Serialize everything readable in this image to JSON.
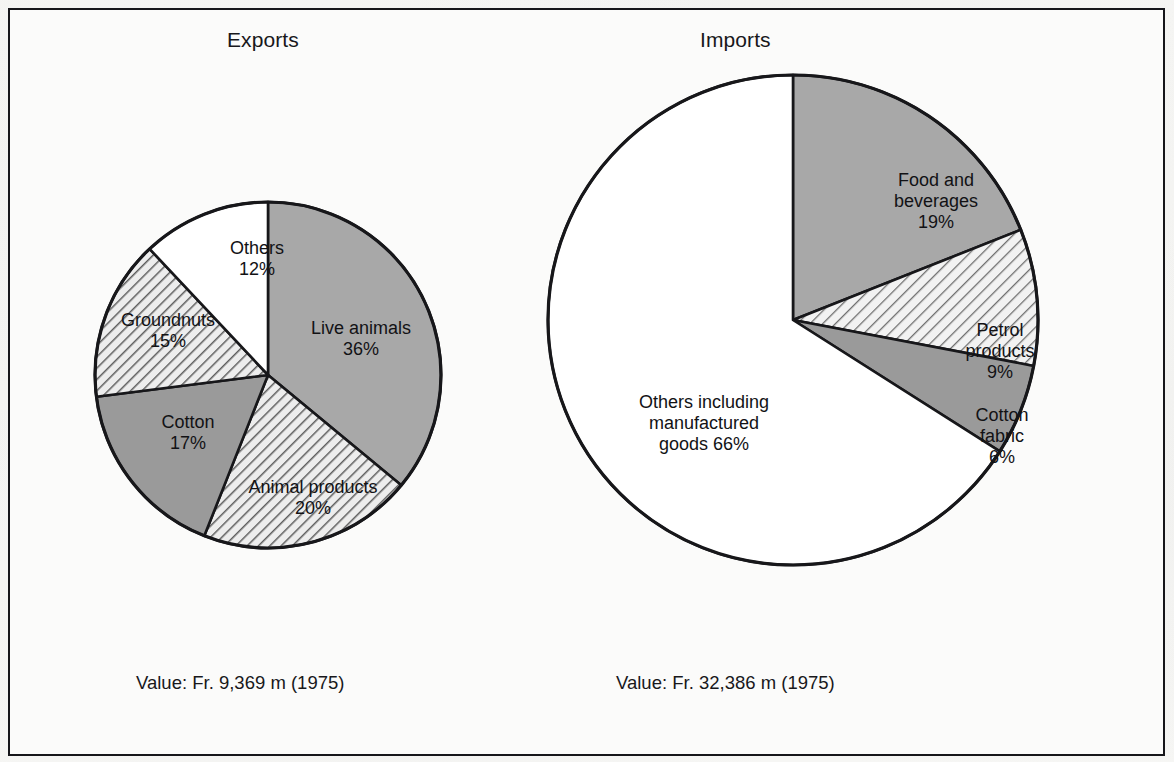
{
  "figure": {
    "background_color": "#f7f7f5",
    "border_color": "#16161a"
  },
  "charts": [
    {
      "id": "exports",
      "title": "Exports",
      "caption": "Value: Fr. 9,369 m (1975)"
    },
    {
      "id": "imports",
      "title": "Imports",
      "caption": "Value: Fr. 32,386 m (1975)"
    }
  ],
  "labels": {
    "exports": {
      "live_animals": "Live animals\n36%",
      "animal_products": "Animal products\n20%",
      "cotton": "Cotton\n17%",
      "groundnuts": "Groundnuts\n15%",
      "others": "Others\n12%"
    },
    "imports": {
      "food_and_beverages": "Food and\nbeverages\n19%",
      "petrol_products": "Petrol\nproducts\n9%",
      "cotton_fabric": "Cotton\nfabric\n6%",
      "others_manufactured": "Others including\nmanufactured\ngoods 66%"
    }
  },
  "chart_data": [
    {
      "type": "pie",
      "id": "exports",
      "title": "Exports",
      "subtitle": "Value: Fr. 9,369 m (1975)",
      "total_value": "Fr. 9,369 m",
      "year": "1975",
      "units": "percent of total export value",
      "start_angle_deg": 0,
      "direction": "clockwise",
      "legend": "inside-slices",
      "labels": [
        "Live animals",
        "Animal products",
        "Cotton",
        "Groundnuts",
        "Others"
      ],
      "values": [
        36,
        20,
        17,
        15,
        12
      ],
      "slices": [
        {
          "label": "Live animals",
          "value": 36,
          "display": "36%",
          "fill": "#a8a8a8",
          "pattern": "solid",
          "start_deg": 0,
          "end_deg": 129.6
        },
        {
          "label": "Animal products",
          "value": 20,
          "display": "20%",
          "fill": "#e6e6e6",
          "pattern": "diagonal-hatch",
          "start_deg": 129.6,
          "end_deg": 201.6
        },
        {
          "label": "Cotton",
          "value": 17,
          "display": "17%",
          "fill": "#9a9a9a",
          "pattern": "solid",
          "start_deg": 201.6,
          "end_deg": 262.8
        },
        {
          "label": "Groundnuts",
          "value": 15,
          "display": "15%",
          "fill": "#dcdcdc",
          "pattern": "diagonal-hatch",
          "start_deg": 262.8,
          "end_deg": 316.8
        },
        {
          "label": "Others",
          "value": 12,
          "display": "12%",
          "fill": "#ffffff",
          "pattern": "solid",
          "start_deg": 316.8,
          "end_deg": 360
        }
      ]
    },
    {
      "type": "pie",
      "id": "imports",
      "title": "Imports",
      "subtitle": "Value: Fr. 32,386 m (1975)",
      "total_value": "Fr. 32,386 m",
      "year": "1975",
      "units": "percent of total import value",
      "start_angle_deg": 0,
      "direction": "clockwise",
      "legend": "inside-slices",
      "labels": [
        "Food and beverages",
        "Petrol products",
        "Cotton fabric",
        "Others including manufactured goods"
      ],
      "values": [
        19,
        9,
        6,
        66
      ],
      "slices": [
        {
          "label": "Food and beverages",
          "value": 19,
          "display": "19%",
          "fill": "#a8a8a8",
          "pattern": "solid",
          "start_deg": 0,
          "end_deg": 68.4
        },
        {
          "label": "Petrol products",
          "value": 9,
          "display": "9%",
          "fill": "#e6e6e6",
          "pattern": "diagonal-hatch",
          "start_deg": 68.4,
          "end_deg": 100.8
        },
        {
          "label": "Cotton fabric",
          "value": 6,
          "display": "6%",
          "fill": "#9a9a9a",
          "pattern": "solid",
          "start_deg": 100.8,
          "end_deg": 122.4
        },
        {
          "label": "Others including manufactured goods",
          "value": 66,
          "display": "66%",
          "fill": "#ffffff",
          "pattern": "solid",
          "start_deg": 122.4,
          "end_deg": 360
        }
      ]
    }
  ]
}
